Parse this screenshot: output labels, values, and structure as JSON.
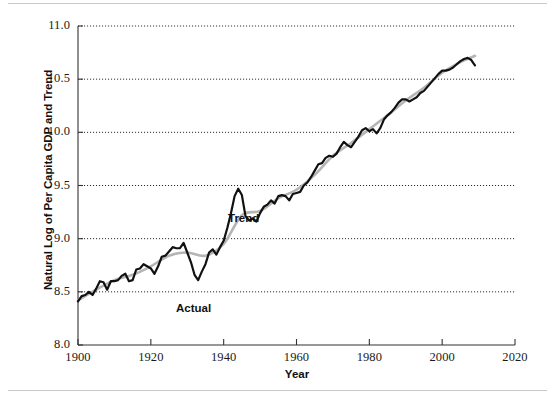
{
  "chart_data": {
    "type": "line",
    "title": "",
    "xlabel": "Year",
    "ylabel": "Natural Log of Per Capita GDP and Trend",
    "xlim": [
      1900,
      2020
    ],
    "ylim": [
      8.0,
      11.0
    ],
    "xticks": [
      1900,
      1920,
      1940,
      1960,
      1980,
      2000,
      2020
    ],
    "yticks": [
      8.0,
      8.5,
      9.0,
      9.5,
      10.0,
      10.5,
      11.0
    ],
    "ytick_labels": [
      "8.0",
      "8.5",
      "9.0",
      "9.5",
      "10.0",
      "10.5",
      "11.0"
    ],
    "xtick_labels": [
      "1900",
      "1920",
      "1940",
      "1960",
      "1980",
      "2000",
      "2020"
    ],
    "grid": "horizontal-dotted",
    "legend_position": "inline-annotations",
    "annotations": [
      {
        "text": "Actual",
        "x": 1928,
        "y": 8.37
      },
      {
        "text": "Trend",
        "x": 1943,
        "y": 9.21
      }
    ],
    "series": [
      {
        "name": "Actual",
        "color": "#111111",
        "style": "solid",
        "width": 2.2,
        "x": [
          1900,
          1901,
          1902,
          1903,
          1904,
          1905,
          1906,
          1907,
          1908,
          1909,
          1910,
          1911,
          1912,
          1913,
          1914,
          1915,
          1916,
          1917,
          1918,
          1919,
          1920,
          1921,
          1922,
          1923,
          1924,
          1925,
          1926,
          1927,
          1928,
          1929,
          1930,
          1931,
          1932,
          1933,
          1934,
          1935,
          1936,
          1937,
          1938,
          1939,
          1940,
          1941,
          1942,
          1943,
          1944,
          1945,
          1946,
          1947,
          1948,
          1949,
          1950,
          1951,
          1952,
          1953,
          1954,
          1955,
          1956,
          1957,
          1958,
          1959,
          1960,
          1961,
          1962,
          1963,
          1964,
          1965,
          1966,
          1967,
          1968,
          1969,
          1970,
          1971,
          1972,
          1973,
          1974,
          1975,
          1976,
          1977,
          1978,
          1979,
          1980,
          1981,
          1982,
          1983,
          1984,
          1985,
          1986,
          1987,
          1988,
          1989,
          1990,
          1991,
          1992,
          1993,
          1994,
          1995,
          1996,
          1997,
          1998,
          1999,
          2000,
          2001,
          2002,
          2003,
          2004,
          2005,
          2006,
          2007,
          2008,
          2009
        ],
        "y": [
          8.41,
          8.46,
          8.47,
          8.5,
          8.47,
          8.53,
          8.6,
          8.59,
          8.52,
          8.6,
          8.6,
          8.61,
          8.65,
          8.67,
          8.6,
          8.61,
          8.71,
          8.72,
          8.76,
          8.74,
          8.72,
          8.67,
          8.74,
          8.83,
          8.84,
          8.88,
          8.92,
          8.91,
          8.91,
          8.96,
          8.87,
          8.78,
          8.66,
          8.61,
          8.69,
          8.76,
          8.87,
          8.9,
          8.85,
          8.92,
          8.98,
          9.1,
          9.24,
          9.4,
          9.47,
          9.41,
          9.21,
          9.17,
          9.19,
          9.16,
          9.24,
          9.3,
          9.32,
          9.36,
          9.33,
          9.4,
          9.41,
          9.4,
          9.36,
          9.42,
          9.43,
          9.44,
          9.5,
          9.53,
          9.58,
          9.64,
          9.7,
          9.71,
          9.76,
          9.78,
          9.77,
          9.8,
          9.86,
          9.91,
          9.88,
          9.86,
          9.91,
          9.96,
          10.02,
          10.04,
          10.01,
          10.03,
          9.99,
          10.04,
          10.12,
          10.16,
          10.19,
          10.23,
          10.28,
          10.31,
          10.31,
          10.29,
          10.31,
          10.33,
          10.37,
          10.39,
          10.43,
          10.47,
          10.51,
          10.55,
          10.58,
          10.58,
          10.59,
          10.61,
          10.64,
          10.67,
          10.69,
          10.7,
          10.68,
          10.63
        ]
      },
      {
        "name": "Trend",
        "color": "#b5b5b5",
        "style": "solid",
        "width": 2.6,
        "x": [
          1900,
          1905,
          1910,
          1915,
          1920,
          1925,
          1930,
          1935,
          1940,
          1945,
          1950,
          1955,
          1960,
          1965,
          1970,
          1975,
          1980,
          1985,
          1990,
          1995,
          2000,
          2005,
          2009
        ],
        "y": [
          8.42,
          8.52,
          8.61,
          8.66,
          8.74,
          8.84,
          8.87,
          8.84,
          8.95,
          9.22,
          9.26,
          9.38,
          9.46,
          9.6,
          9.78,
          9.9,
          10.03,
          10.16,
          10.3,
          10.42,
          10.56,
          10.66,
          10.72
        ]
      }
    ]
  },
  "axes": {
    "y_label_text": "Natural Log of Per Capita GDP and Trend",
    "x_label_text": "Year"
  }
}
